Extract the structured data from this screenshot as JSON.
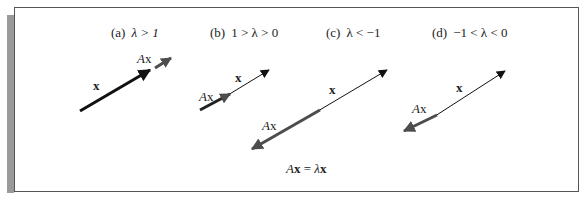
{
  "figure": {
    "equation": {
      "lhs": "A",
      "lhs_vec": "x",
      "eq": " = ",
      "lambda": "λ",
      "rhs_vec": "x"
    },
    "colors": {
      "frame": "#555555",
      "shadow": "#9a9a9a",
      "x_vector": "#111111",
      "Ax_vector": "#4d4d4d",
      "text": "#222222"
    },
    "panels": [
      {
        "id": "a",
        "tag": "(a)",
        "condition": "λ > 1",
        "x_label": "x",
        "Ax_label_A": "A",
        "Ax_label_x": "x"
      },
      {
        "id": "b",
        "tag": "(b)",
        "condition": "1 > λ > 0",
        "x_label": "x",
        "Ax_label_A": "A",
        "Ax_label_x": "x"
      },
      {
        "id": "c",
        "tag": "(c)",
        "condition": "λ < −1",
        "x_label": "x",
        "Ax_label_A": "A",
        "Ax_label_x": "x"
      },
      {
        "id": "d",
        "tag": "(d)",
        "condition": "−1 < λ < 0",
        "x_label": "x",
        "Ax_label_A": "A",
        "Ax_label_x": "x"
      }
    ]
  }
}
